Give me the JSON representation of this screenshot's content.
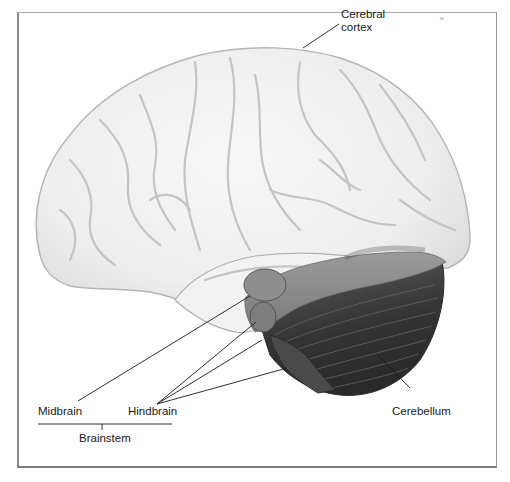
{
  "diagram": {
    "type": "anatomical-illustration",
    "labels": {
      "cerebral_cortex_line1": "Cerebral",
      "cerebral_cortex_line2": "cortex",
      "midbrain": "Midbrain",
      "hindbrain": "Hindbrain",
      "brainstem": "Brainstem",
      "cerebellum": "Cerebellum"
    },
    "stray_mark": "u",
    "regions": [
      {
        "name": "cerebral-cortex",
        "shade": "#ececec"
      },
      {
        "name": "midbrain",
        "shade": "#8e8e8e"
      },
      {
        "name": "pons",
        "shade": "#7d7d7d"
      },
      {
        "name": "medulla",
        "shade": "#4a4a4a"
      },
      {
        "name": "cerebellum",
        "shade": "#3a3a3a"
      }
    ],
    "colors": {
      "frame": "#8a8a8a",
      "leader_lines": "#1a1a1a",
      "text": "#1a1a1a",
      "background": "#ffffff"
    }
  }
}
